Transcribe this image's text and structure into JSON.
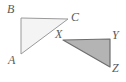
{
  "figure": {
    "background_color": "#ffffff",
    "stroke_color": "#8c8c8c",
    "label_color": "#595959",
    "triangles": [
      {
        "name": "triangle-abc",
        "fill_color": "#f4f4f4",
        "stroke_color": "#9a9a9a",
        "vertices": [
          {
            "id": "B",
            "label": "B",
            "x": 21,
            "y": 18,
            "label_x": 7,
            "label_y": 3
          },
          {
            "id": "C",
            "label": "C",
            "x": 68,
            "y": 19,
            "label_x": 71,
            "label_y": 11
          },
          {
            "id": "A",
            "label": "A",
            "x": 21,
            "y": 54,
            "label_x": 8,
            "label_y": 54
          }
        ],
        "right_angle_at": "B"
      },
      {
        "name": "triangle-xyz",
        "fill_color": "#b4b4b4",
        "stroke_color": "#6e6e6e",
        "vertices": [
          {
            "id": "X",
            "label": "X",
            "x": 63,
            "y": 40,
            "label_x": 55,
            "label_y": 28
          },
          {
            "id": "Y",
            "label": "Y",
            "x": 110,
            "y": 39,
            "label_x": 112,
            "label_y": 29
          },
          {
            "id": "Z",
            "label": "Z",
            "x": 110,
            "y": 67,
            "label_x": 112,
            "label_y": 62
          }
        ],
        "right_angle_at": "Y"
      }
    ]
  }
}
